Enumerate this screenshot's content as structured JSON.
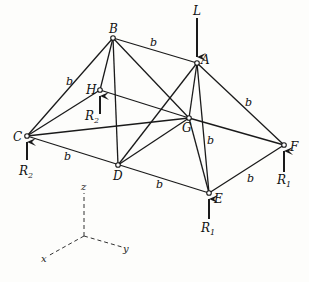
{
  "diagram": {
    "type": "space-truss",
    "nodes": {
      "A": {
        "label": "A"
      },
      "B": {
        "label": "B"
      },
      "C": {
        "label": "C"
      },
      "D": {
        "label": "D"
      },
      "E": {
        "label": "E"
      },
      "F": {
        "label": "F"
      },
      "G": {
        "label": "G"
      },
      "H": {
        "label": "H"
      }
    },
    "member_length_label": "b",
    "loads": {
      "L": {
        "label": "L",
        "at": "A",
        "direction": "down"
      }
    },
    "reactions": {
      "R_C": {
        "label": "R",
        "sub": "2",
        "at": "C"
      },
      "R_H": {
        "label": "R",
        "sub": "2",
        "at": "H"
      },
      "R_E": {
        "label": "R",
        "sub": "1",
        "at": "E"
      },
      "R_F": {
        "label": "R",
        "sub": "1",
        "at": "F"
      }
    },
    "axes": {
      "x": "x",
      "y": "y",
      "z": "z"
    },
    "colors": {
      "line": "#1a1a1a",
      "background": "#fdfdfb"
    }
  }
}
